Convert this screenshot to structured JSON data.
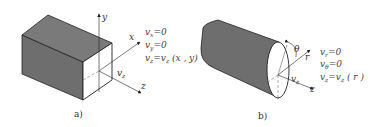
{
  "figure": {
    "panels": [
      {
        "caption": "a)",
        "shape": "rectangular duct",
        "axes": {
          "y": "y",
          "x": "x",
          "z": "z"
        },
        "velocity_label": "v",
        "velocity_sub": "z",
        "equations": [
          {
            "lhs": "v",
            "sub": "x",
            "rhs": "=0"
          },
          {
            "lhs": "v",
            "sub": "y",
            "rhs": "=0"
          },
          {
            "lhs": "v",
            "sub": "z",
            "rhs": "=v",
            "rhs_sub": "z",
            "tail": " (x , y)"
          }
        ]
      },
      {
        "caption": "b)",
        "shape": "circular pipe",
        "axes": {
          "theta": "θ",
          "r": "r",
          "z": "z"
        },
        "velocity_label": "v",
        "velocity_sub": "z",
        "equations": [
          {
            "lhs": "v",
            "sub": "r",
            "rhs": "=0"
          },
          {
            "lhs": "v",
            "sub": "θ",
            "rhs": "=0"
          },
          {
            "lhs": "v",
            "sub": "z",
            "rhs": "=v",
            "rhs_sub": "z",
            "tail": " ( r )"
          }
        ]
      }
    ],
    "colors": {
      "solid_fill": "#6e6e6e",
      "line": "#222222",
      "face": "#ffffff"
    }
  }
}
